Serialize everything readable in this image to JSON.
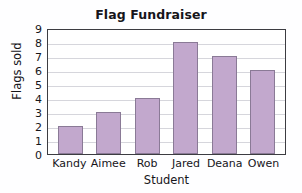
{
  "chart_data": {
    "type": "bar",
    "title": "Flag Fundraiser",
    "xlabel": "Student",
    "ylabel": "Flags sold",
    "categories": [
      "Kandy",
      "Aimee",
      "Rob",
      "Jared",
      "Deana",
      "Owen"
    ],
    "values": [
      2,
      3,
      4,
      8,
      7,
      6
    ],
    "ylim": [
      0,
      9
    ],
    "ytick_labels": [
      "9",
      "8",
      "7",
      "6",
      "5",
      "4",
      "3",
      "2",
      "1",
      "0"
    ],
    "ytick_values": [
      9,
      8,
      7,
      6,
      5,
      4,
      3,
      2,
      1,
      0
    ],
    "ystep": 1,
    "grid": true,
    "legend": false,
    "bar_color": "#c2a8cd",
    "bar_border_color": "#8a7a96",
    "grid_color": "#d6d6dc",
    "axis_color": "#3c3c41",
    "background": "#ffffff"
  }
}
